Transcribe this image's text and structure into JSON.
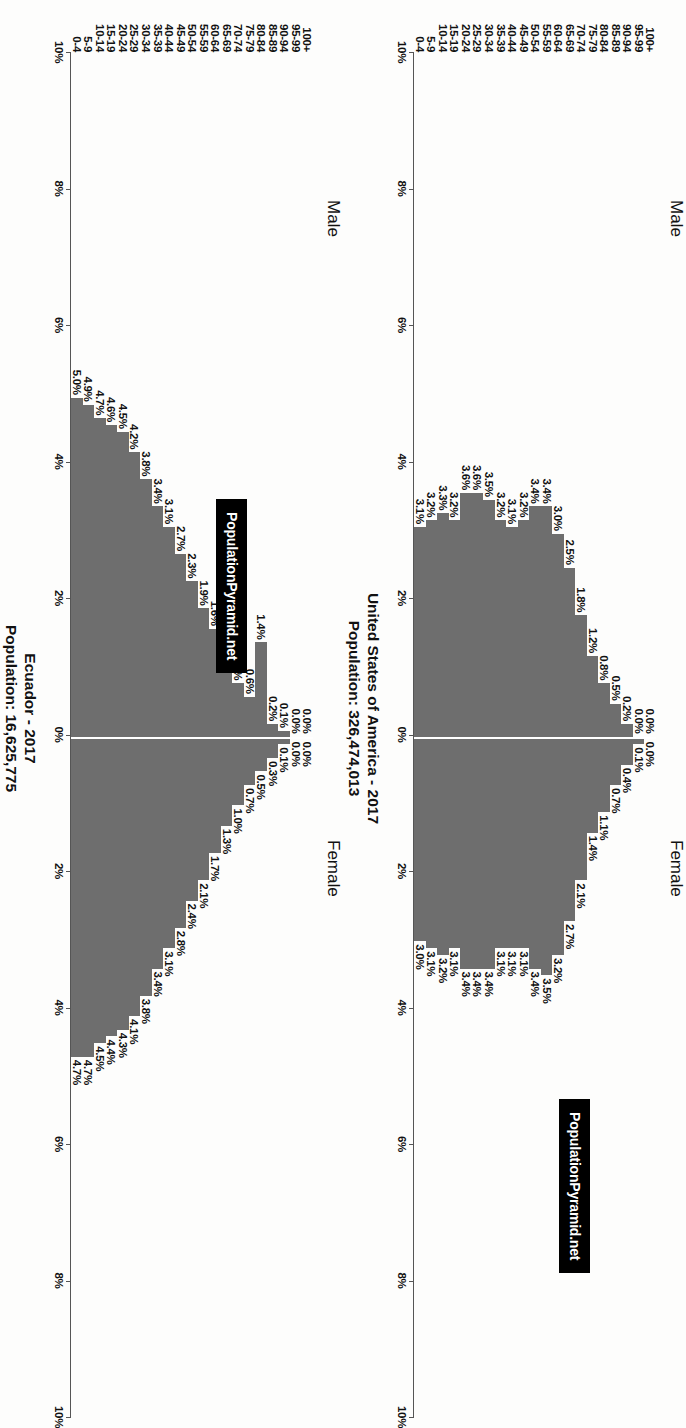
{
  "page": {
    "background": "#fdfdfc",
    "bar_color": "#6e6e6e",
    "axis_color": "#555555",
    "rotation": "90deg-clockwise"
  },
  "charts": [
    {
      "id": "ecuador",
      "title_line1": "Ecuador - 2017",
      "title_line2": "Population: 16,625,775",
      "badge": "PopulationPyramid.net",
      "male_label": "Male",
      "female_label": "Female",
      "axis_ticks": [
        "10%",
        "8%",
        "6%",
        "4%",
        "2%",
        "0%",
        "2%",
        "4%",
        "6%",
        "8%",
        "10%"
      ],
      "axis_max": 10,
      "chart_data": {
        "type": "bar",
        "title": "Ecuador - 2017",
        "subtitle": "Population: 16,625,775",
        "xlabel": "",
        "ylabel": "",
        "xlim": [
          -10,
          10
        ],
        "grid": false,
        "legend_position": "top",
        "categories": [
          "100+",
          "95-99",
          "90-94",
          "85-89",
          "80-84",
          "75-79",
          "70-74",
          "65-69",
          "60-64",
          "55-59",
          "50-54",
          "45-49",
          "40-44",
          "35-39",
          "30-34",
          "25-29",
          "20-24",
          "15-19",
          "10-14",
          "5-9",
          "0-4"
        ],
        "series": [
          {
            "name": "Male",
            "values": [
              0.0,
              0.0,
              0.1,
              0.2,
              1.4,
              0.6,
              0.8,
              1.2,
              1.6,
              1.9,
              2.3,
              2.7,
              3.1,
              3.4,
              3.8,
              4.2,
              4.5,
              4.6,
              4.7,
              4.9,
              5.0
            ]
          },
          {
            "name": "Female",
            "values": [
              0.0,
              0.0,
              0.1,
              0.3,
              0.5,
              0.7,
              1.0,
              1.3,
              1.7,
              2.1,
              2.4,
              2.8,
              3.1,
              3.4,
              3.8,
              4.1,
              4.3,
              4.4,
              4.5,
              4.7,
              4.7
            ]
          }
        ],
        "male_labels": [
          "0.0%",
          "0.0%",
          "0.1%",
          "0.2%",
          "1.4%",
          "0.6%",
          "0.8%",
          "1.2%",
          "1.6%",
          "1.9%",
          "2.3%",
          "2.7%",
          "3.1%",
          "3.4%",
          "3.8%",
          "4.2%",
          "4.5%",
          "4.6%",
          "4.7%",
          "4.9%",
          "5.0%"
        ],
        "female_labels": [
          "0.0%",
          "0.0%",
          "0.1%",
          "0.3%",
          "0.5%",
          "0.7%",
          "1.0%",
          "1.3%",
          "1.7%",
          "2.1%",
          "2.4%",
          "2.8%",
          "3.1%",
          "3.4%",
          "3.8%",
          "4.1%",
          "4.3%",
          "4.4%",
          "4.5%",
          "4.7%",
          "4.7%"
        ]
      }
    },
    {
      "id": "usa",
      "title_line1": "United States of America - 2017",
      "title_line2": "Population: 326,474,013",
      "badge": "PopulationPyramid.net",
      "male_label": "Male",
      "female_label": "Female",
      "axis_ticks": [
        "10%",
        "8%",
        "6%",
        "4%",
        "2%",
        "0%",
        "2%",
        "4%",
        "6%",
        "8%",
        "10%"
      ],
      "axis_max": 10,
      "chart_data": {
        "type": "bar",
        "title": "United States of America - 2017",
        "subtitle": "Population: 326,474,013",
        "xlabel": "",
        "ylabel": "",
        "xlim": [
          -10,
          10
        ],
        "grid": false,
        "legend_position": "top",
        "categories": [
          "100+",
          "95-99",
          "90-94",
          "85-89",
          "80-84",
          "75-79",
          "70-74",
          "65-69",
          "60-64",
          "55-59",
          "50-54",
          "45-49",
          "40-44",
          "35-39",
          "30-34",
          "25-29",
          "20-24",
          "15-19",
          "10-14",
          "5-9",
          "0-4"
        ],
        "series": [
          {
            "name": "Male",
            "values": [
              0.0,
              0.0,
              0.2,
              0.5,
              0.8,
              1.2,
              1.8,
              2.5,
              3.0,
              3.4,
              3.4,
              3.2,
              3.1,
              3.2,
              3.5,
              3.6,
              3.6,
              3.2,
              3.3,
              3.2,
              3.1
            ]
          },
          {
            "name": "Female",
            "values": [
              0.0,
              0.1,
              0.4,
              0.7,
              1.1,
              1.4,
              2.1,
              2.7,
              3.2,
              3.5,
              3.4,
              3.1,
              3.1,
              3.1,
              3.4,
              3.4,
              3.4,
              3.1,
              3.2,
              3.1,
              3.0
            ]
          }
        ],
        "male_labels": [
          "0.0%",
          "0.0%",
          "0.2%",
          "0.5%",
          "0.8%",
          "1.2%",
          "1.8%",
          "2.5%",
          "3.0%",
          "3.4%",
          "3.4%",
          "3.2%",
          "3.1%",
          "3.2%",
          "3.5%",
          "3.6%",
          "3.6%",
          "3.2%",
          "3.3%",
          "3.2%",
          "3.1%"
        ],
        "female_labels": [
          "0.0%",
          "0.1%",
          "0.4%",
          "0.7%",
          "1.1%",
          "1.4%",
          "2.1%",
          "2.7%",
          "3.2%",
          "3.5%",
          "3.4%",
          "3.1%",
          "3.1%",
          "3.1%",
          "3.4%",
          "3.4%",
          "3.4%",
          "3.1%",
          "3.2%",
          "3.1%",
          "3.0%"
        ]
      }
    }
  ]
}
